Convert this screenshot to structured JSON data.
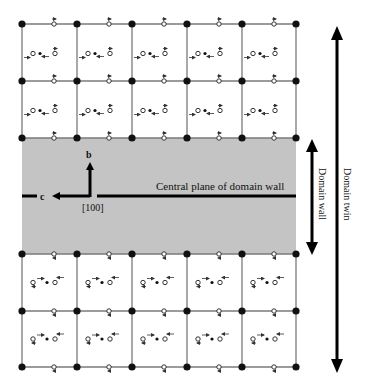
{
  "diagram": {
    "colors": {
      "background": "#ffffff",
      "wall_band": "#c4c4c4",
      "grid_line": "#7a7a7a",
      "atom": "#111111",
      "arrow": "#000000",
      "text": "#111111"
    },
    "grid": {
      "columns_x": [
        22,
        77,
        132,
        187,
        242,
        296
      ],
      "top_rows_y": [
        24,
        81,
        138
      ],
      "bottom_rows_y": [
        254,
        311,
        367
      ],
      "top_cell_pattern": "o • →o (polarization left, upper domain)",
      "bottom_cell_pattern": "o →• o (polarization right, lower domain)"
    },
    "wall_band": {
      "x": 22,
      "y": 138,
      "width": 274,
      "height": 116
    },
    "axes": {
      "b_label": "b",
      "c_label": "c",
      "direction_label": "[100]"
    },
    "labels": {
      "central_plane": "Central plane of domain wall",
      "domain_wall": "Domain wall",
      "domain_twin": "Domain twin"
    }
  }
}
